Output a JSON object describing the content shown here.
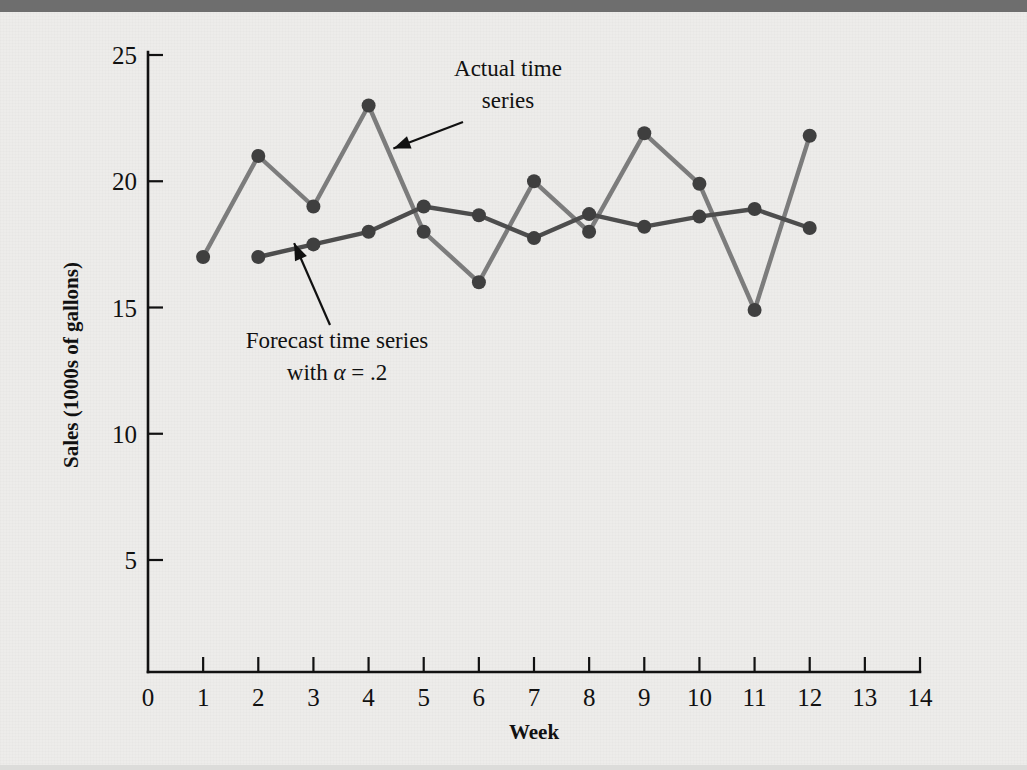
{
  "figure": {
    "background_color": "#edecea",
    "top_bar_color": "#6e6e6e"
  },
  "chart_data": {
    "type": "line",
    "title": "",
    "xlabel": "Week",
    "ylabel": "Sales (1000s of gallons)",
    "xlim": [
      0,
      14
    ],
    "ylim": [
      0,
      25
    ],
    "xticks": [
      "0",
      "1",
      "2",
      "3",
      "4",
      "5",
      "6",
      "7",
      "8",
      "9",
      "10",
      "11",
      "12",
      "13",
      "14"
    ],
    "yticks": [
      "5",
      "10",
      "15",
      "20",
      "25"
    ],
    "grid": false,
    "legend_position": "annotations-inline",
    "series": [
      {
        "name": "Actual time series",
        "color": "#7c7c7c",
        "x": [
          1,
          2,
          3,
          4,
          5,
          6,
          7,
          8,
          9,
          10,
          11,
          12
        ],
        "values": [
          17,
          21,
          19,
          23,
          18,
          16,
          20,
          18,
          21.9,
          19.9,
          14.9,
          21.8
        ]
      },
      {
        "name": "Forecast time series with alpha = .2",
        "color": "#4d4d4d",
        "x": [
          2,
          3,
          4,
          5,
          6,
          7,
          8,
          9,
          10,
          11,
          12
        ],
        "values": [
          17,
          17.5,
          18,
          19,
          18.65,
          17.75,
          18.7,
          18.2,
          18.6,
          18.9,
          18.15
        ]
      }
    ],
    "annotations": [
      {
        "id": "actual-annotation",
        "line1": "Actual time",
        "line2": "series",
        "target_week": 4.45,
        "target_value": 21.3
      },
      {
        "id": "forecast-annotation",
        "line1": "Forecast time series",
        "line2_prefix": "with ",
        "line2_symbol": "α",
        "line2_suffix": " = .2",
        "target_week": 2.65,
        "target_value": 17.55
      }
    ]
  }
}
